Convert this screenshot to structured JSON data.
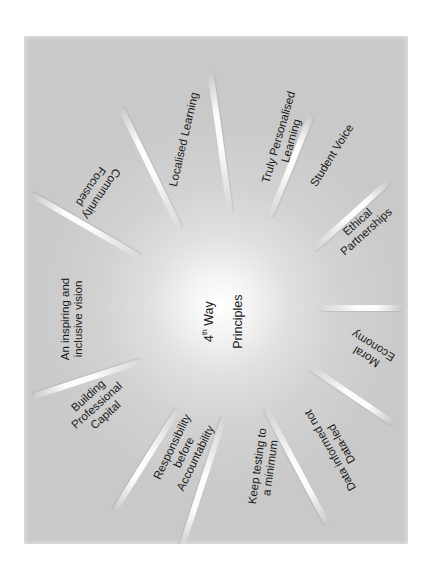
{
  "diagram": {
    "type": "radial-spoke",
    "center": {
      "label_line1_prefix": "4",
      "label_line1_sup": "th",
      "label_line1_suffix": " Way",
      "label_line2": "Principles"
    },
    "colors": {
      "panel": "#c9c9c9",
      "center_glow": "#ffffff",
      "ray": "#ffffff",
      "text": "#1a1a1a"
    },
    "principles": [
      {
        "id": "localised-learning",
        "label": "Localised Learning"
      },
      {
        "id": "truly-personalised-learning",
        "label": "Truly Personalised\nLearning"
      },
      {
        "id": "student-voice",
        "label": "Student Voice"
      },
      {
        "id": "ethical-partnerships",
        "label": "Ethical\nPartnerships"
      },
      {
        "id": "moral-economy",
        "label": "Moral\nEconomy"
      },
      {
        "id": "data-informed",
        "label": "Data informed not\nData-led"
      },
      {
        "id": "keep-testing",
        "label": "Keep testing to\na minimum"
      },
      {
        "id": "responsibility",
        "label": "Responsibility\nbefore\nAccountability"
      },
      {
        "id": "professional-capital",
        "label": "Building\nProfessional\nCapital"
      },
      {
        "id": "inspiring-vision",
        "label": "An inspiring and\ninclusive vision"
      },
      {
        "id": "community-focused",
        "label": "Community\nFocused"
      }
    ]
  }
}
